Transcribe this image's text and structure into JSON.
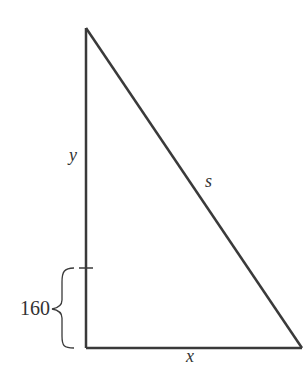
{
  "diagram": {
    "type": "right-triangle",
    "labels": {
      "vertical_side": "y",
      "hypotenuse": "s",
      "horizontal_side": "x",
      "brace_length": "160"
    },
    "colors": {
      "stroke": "#3a3a3a",
      "background": "#ffffff"
    }
  }
}
